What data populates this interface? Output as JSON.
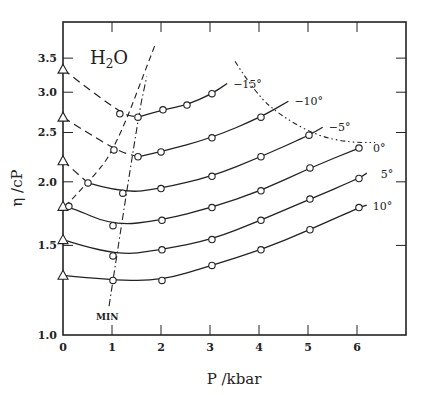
{
  "chart_data": {
    "type": "line",
    "title": "H2O",
    "title_main": "H",
    "title_sub": "2",
    "title_tail": "O",
    "xlabel": "P  /kbar",
    "ylabel": "η /cP",
    "xlim": [
      0,
      7
    ],
    "ylim": [
      1.0,
      3.9
    ],
    "yscale": "log",
    "x_ticks": [
      0,
      1,
      2,
      3,
      4,
      5,
      6
    ],
    "x_tick_labels": [
      "0",
      "1",
      "2",
      "3",
      "4",
      "5",
      "6"
    ],
    "y_ticks": [
      1.0,
      1.5,
      2.0,
      2.5,
      3.0,
      3.5
    ],
    "y_tick_labels": [
      "1.0",
      "1.5",
      "2.0",
      "2.5",
      "3.0",
      "3.5"
    ],
    "grid": false,
    "legend": "inline curve labels at right ends",
    "series": [
      {
        "name": "-15°",
        "label": "−15°",
        "triangle_at_P0": 3.33,
        "x": [
          1.16,
          1.53,
          2.04,
          2.53,
          3.04
        ],
        "values": [
          2.72,
          2.68,
          2.77,
          2.83,
          2.98
        ],
        "line_end": [
          3.35,
          3.12
        ]
      },
      {
        "name": "-10°",
        "label": "−10°",
        "triangle_at_P0": 2.68,
        "x": [
          1.04,
          1.53,
          2.0,
          3.04,
          4.04
        ],
        "values": [
          2.31,
          2.24,
          2.29,
          2.44,
          2.68
        ],
        "line_end": [
          4.6,
          2.88
        ]
      },
      {
        "name": "-5°",
        "label": "−5°",
        "triangle_at_P0": 2.2,
        "x": [
          0.51,
          1.22,
          2.0,
          3.04,
          4.04,
          5.02
        ],
        "values": [
          1.99,
          1.9,
          1.94,
          2.05,
          2.24,
          2.47
        ],
        "line_end": [
          5.3,
          2.56
        ]
      },
      {
        "name": "0°",
        "label": "0°",
        "triangle_at_P0": 1.79,
        "x": [
          0.12,
          1.02,
          2.02,
          3.04,
          4.04,
          5.04,
          6.04
        ],
        "values": [
          1.79,
          1.64,
          1.68,
          1.78,
          1.92,
          2.13,
          2.33
        ],
        "line_end": [
          6.04,
          2.33
        ]
      },
      {
        "name": "5°",
        "label": "5°",
        "triangle_at_P0": 1.54,
        "x": [
          1.02,
          2.02,
          3.04,
          4.04,
          5.04,
          6.04
        ],
        "values": [
          1.43,
          1.47,
          1.54,
          1.68,
          1.85,
          2.03
        ],
        "line_end": [
          6.2,
          2.08
        ]
      },
      {
        "name": "10°",
        "label": "10°",
        "triangle_at_P0": 1.31,
        "x": [
          1.02,
          2.02,
          3.04,
          4.04,
          5.04,
          6.04
        ],
        "values": [
          1.28,
          1.28,
          1.37,
          1.47,
          1.61,
          1.78
        ],
        "line_end": [
          6.2,
          1.8
        ]
      }
    ],
    "annotations": [
      {
        "text": "MIN",
        "description": "dash-dot locus of viscosity minima",
        "points": [
          [
            0.94,
            1.14
          ],
          [
            1.53,
            2.68
          ],
          [
            1.71,
            3.22
          ]
        ]
      },
      {
        "text": "",
        "description": "dashed freezing curve",
        "points": [
          [
            0.04,
            1.79
          ],
          [
            0.51,
            1.99
          ],
          [
            1.06,
            2.31
          ],
          [
            1.88,
            3.72
          ]
        ]
      },
      {
        "text": "",
        "description": "dash-dot homogeneous nucleation boundary",
        "points": [
          [
            3.51,
            3.45
          ],
          [
            3.94,
            2.97
          ],
          [
            4.49,
            2.68
          ],
          [
            5.2,
            2.46
          ],
          [
            5.86,
            2.39
          ],
          [
            6.37,
            2.39
          ]
        ]
      }
    ]
  }
}
